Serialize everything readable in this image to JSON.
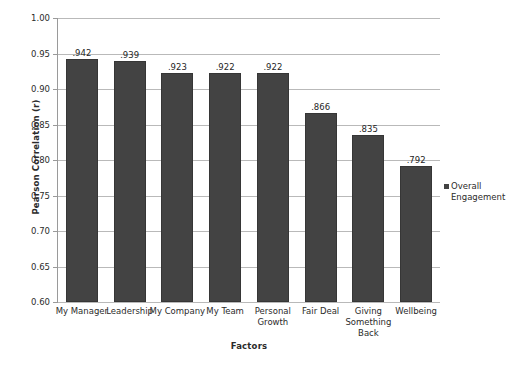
{
  "chart_data": {
    "type": "bar",
    "title": "",
    "xlabel": "Factors",
    "ylabel": "Pearson Correlation (r)",
    "categories": [
      "My Manager",
      "Leadership",
      "My Company",
      "My Team",
      "Personal Growth",
      "Fair Deal",
      "Giving Something Back",
      "Wellbeing"
    ],
    "values": [
      0.942,
      0.939,
      0.923,
      0.922,
      0.922,
      0.866,
      0.835,
      0.792
    ],
    "data_labels": [
      ".942",
      ".939",
      ".923",
      ".922",
      ".922",
      ".866",
      ".835",
      ".792"
    ],
    "series": [
      {
        "name": "Overall Engagement",
        "values": [
          0.942,
          0.939,
          0.923,
          0.922,
          0.922,
          0.866,
          0.835,
          0.792
        ]
      }
    ],
    "ylim": [
      0.6,
      1.0
    ],
    "ytick_values": [
      1.0,
      0.95,
      0.9,
      0.85,
      0.8,
      0.75,
      0.7,
      0.65,
      0.6
    ],
    "ytick_labels": [
      "1.00",
      "0.95",
      "0.90",
      "0.85",
      "0.80",
      "0.75",
      "0.70",
      "0.65",
      "0.60"
    ],
    "grid": true,
    "legend_position": "right",
    "legend_entries": [
      "Overall Engagement"
    ],
    "bar_color": "#434343",
    "gridline_color": "#b9b9b9",
    "background_color": "#ffffff"
  },
  "legend": {
    "label": "Overall Engagement"
  }
}
